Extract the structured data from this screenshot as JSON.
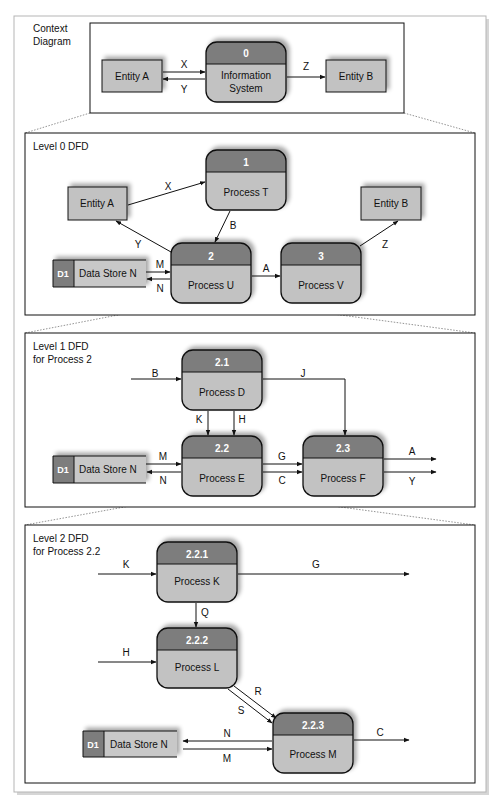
{
  "colors": {
    "process_header": "#7d7d7d",
    "process_body": "#c2c2c2",
    "entity_fill": "#c2c2c2",
    "datastore_id_fill": "#7d7d7d",
    "datastore_fill": "#c8c8c8",
    "border": "#111111"
  },
  "context": {
    "title_line1": "Context",
    "title_line2": "Diagram",
    "entity_a": "Entity A",
    "entity_b": "Entity B",
    "process": {
      "id": "0",
      "name_line1": "Information",
      "name_line2": "System"
    },
    "flows": {
      "x": "X",
      "y": "Y",
      "z": "Z"
    }
  },
  "level0": {
    "title": "Level 0 DFD",
    "entity_a": "Entity A",
    "entity_b": "Entity B",
    "datastore": {
      "id": "D1",
      "name": "Data Store N"
    },
    "processes": [
      {
        "id": "1",
        "name": "Process T"
      },
      {
        "id": "2",
        "name": "Process U"
      },
      {
        "id": "3",
        "name": "Process V"
      }
    ],
    "flows": {
      "x": "X",
      "y": "Y",
      "b": "B",
      "m": "M",
      "n": "N",
      "a": "A",
      "z": "Z"
    }
  },
  "level1": {
    "title_line1": "Level 1 DFD",
    "title_line2": "for Process 2",
    "datastore": {
      "id": "D1",
      "name": "Data Store N"
    },
    "processes": [
      {
        "id": "2.1",
        "name": "Process D"
      },
      {
        "id": "2.2",
        "name": "Process E"
      },
      {
        "id": "2.3",
        "name": "Process F"
      }
    ],
    "flows": {
      "b": "B",
      "j": "J",
      "k": "K",
      "h": "H",
      "m": "M",
      "n": "N",
      "g": "G",
      "c": "C",
      "a": "A",
      "y": "Y"
    }
  },
  "level2": {
    "title_line1": "Level 2 DFD",
    "title_line2": "for Process 2.2",
    "datastore": {
      "id": "D1",
      "name": "Data Store N"
    },
    "processes": [
      {
        "id": "2.2.1",
        "name": "Process K"
      },
      {
        "id": "2.2.2",
        "name": "Process L"
      },
      {
        "id": "2.2.3",
        "name": "Process M"
      }
    ],
    "flows": {
      "k": "K",
      "g": "G",
      "q": "Q",
      "h": "H",
      "r": "R",
      "s": "S",
      "n": "N",
      "m": "M",
      "c": "C"
    }
  }
}
